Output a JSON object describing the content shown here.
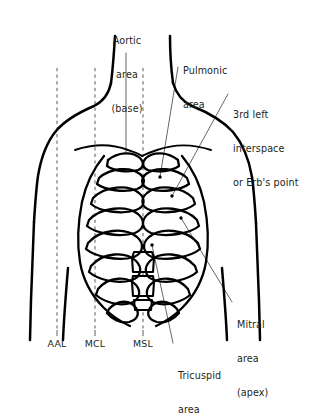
{
  "figure": {
    "ink_color": "#000000",
    "text_color": "#231f20",
    "dashed_line_color": "#6d6d6d",
    "leader_color": "#4a4a4a",
    "background": "#ffffff"
  },
  "labels": {
    "aortic": "Aortic\narea\n(base)",
    "aortic_line1": "Aortic",
    "aortic_line2": "area",
    "aortic_line3": "(base)",
    "pulmonic": "Pulmonic\narea",
    "pulmonic_line1": "Pulmonic",
    "pulmonic_line2": "area",
    "erb": "3rd left\ninterspace\nor Erb's point",
    "erb_line1": "3rd left",
    "erb_line2": "interspace",
    "erb_line3": "or Erb's point",
    "mitral": "Mitral\narea\n(apex)",
    "mitral_line1": "Mitral",
    "mitral_line2": "area",
    "mitral_line3": "(apex)",
    "tricuspid": "Tricuspid\narea",
    "tricuspid_line1": "Tricuspid",
    "tricuspid_line2": "area"
  },
  "vertical_lines": [
    {
      "id": "aal",
      "label": "AAL",
      "x": 57,
      "style": "dashed",
      "name": "anterior-axillary-line"
    },
    {
      "id": "mcl",
      "label": "MCL",
      "x": 95,
      "style": "dashed",
      "name": "midclavicular-line"
    },
    {
      "id": "msl",
      "label": "MSL",
      "x": 143,
      "style": "dashed",
      "name": "midsternal-line"
    }
  ],
  "axis_labels": {
    "aal": "AAL",
    "mcl": "MCL",
    "msl": "MSL"
  },
  "caption": {
    "text": ""
  }
}
